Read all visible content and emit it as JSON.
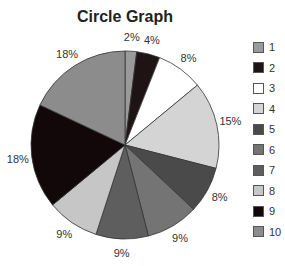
{
  "chart_data": {
    "type": "pie",
    "title": "Circle Graph",
    "categories": [
      "1",
      "2",
      "3",
      "4",
      "5",
      "6",
      "7",
      "8",
      "9",
      "10"
    ],
    "values": [
      2,
      4,
      8,
      15,
      8,
      9,
      9,
      9,
      18,
      18
    ],
    "labels": [
      "2%",
      "4%",
      "8%",
      "15%",
      "8%",
      "9%",
      "9%",
      "9%",
      "18%",
      "18%"
    ],
    "colors": [
      "#9a9a9a",
      "#1e1416",
      "#ffffff",
      "#d4d4d4",
      "#4a4a4a",
      "#747474",
      "#5e5e5e",
      "#c6c6c6",
      "#120809",
      "#8c8c8c"
    ],
    "legend_position": "right"
  },
  "legend": [
    {
      "label": "1"
    },
    {
      "label": "2"
    },
    {
      "label": "3"
    },
    {
      "label": "4"
    },
    {
      "label": "5"
    },
    {
      "label": "6"
    },
    {
      "label": "7"
    },
    {
      "label": "8"
    },
    {
      "label": "9"
    },
    {
      "label": "10"
    }
  ]
}
